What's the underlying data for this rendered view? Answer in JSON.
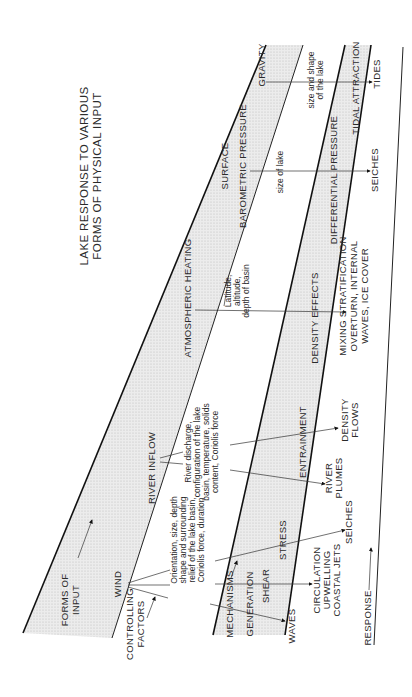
{
  "title": {
    "line1": "LAKE RESPONSE TO VARIOUS",
    "line2": "FORMS OF PHYSICAL INPUT"
  },
  "bands": {
    "forms_of_input": [
      "FORMS OF",
      "INPUT"
    ],
    "controlling_factors": [
      "CONTROLLING",
      "FACTORS"
    ],
    "mechanisms": "MECHANISMS",
    "generation": "GENERATION",
    "response": "RESPONSE"
  },
  "inputs": {
    "gravity": "GRAVITY",
    "surface": "SURFACE",
    "barometric_pressure": "BAROMETRIC PRESSURE",
    "atmospheric_heating": "ATMOSPHERIC HEATING",
    "river_inflow": "RIVER INFLOW",
    "wind": "WIND"
  },
  "controlling_factors": {
    "gravity": [
      "size and shape",
      "of the lake"
    ],
    "pressure": "size of lake",
    "heating": [
      "Latitude,",
      "altitude,",
      "depth of basin"
    ],
    "river": [
      "River discharge,",
      "configuration of the lake",
      "basin, temperature, solids",
      "content, Coriolis force"
    ],
    "wind": [
      "Orientation, size, depth",
      "shape and surrounding",
      "relief of the lake basin,",
      "Coriolis force, duration"
    ]
  },
  "mechanisms": {
    "tidal_attraction": "TIDAL ATTRACTION",
    "differential_pressure": "DIFFERENTIAL PRESSURE",
    "density_effects": "DENSITY EFFECTS",
    "entrainment": "ENTRAINMENT",
    "stress": "STRESS",
    "shear": "SHEAR",
    "waves": "WAVES"
  },
  "responses": {
    "tides": "TIDES",
    "seiches_top": "SEICHES",
    "mixing": [
      "MIXING STRATIFICATION",
      "OVERTURN, INTERNAL",
      "WAVES, ICE COVER"
    ],
    "density_flows": [
      "DENSITY",
      "FLOWS"
    ],
    "river_plumes": [
      "RIVER",
      "PLUMES"
    ],
    "seiches_bottom": "SEICHES",
    "circulation": [
      "CIRCULATION",
      "UPWELLING",
      "COASTAL JETS"
    ]
  },
  "colors": {
    "band_fill": "#e6e6e6",
    "line": "#222222",
    "text": "#2a2a2a"
  }
}
